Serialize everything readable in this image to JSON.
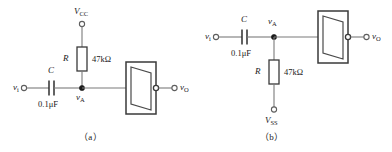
{
  "figure": {
    "background": "#ffffff",
    "wire_color": "#6b6b6b",
    "component_color": "#3a3a3a",
    "text_color": "#1a1a1a"
  },
  "circuits": [
    {
      "caption": "（a）",
      "supply": {
        "label_v": "V",
        "label_sub": "CC",
        "position": "top",
        "terminal": "open-circle"
      },
      "resistor": {
        "ref": "R",
        "value": "47kΩ",
        "orientation": "vertical",
        "position": "above-node"
      },
      "capacitor": {
        "ref": "C",
        "value": "0.1μF",
        "orientation": "horizontal"
      },
      "input": {
        "label_v": "v",
        "label_sub": "i",
        "terminal": "open-circle"
      },
      "node": {
        "label_v": "v",
        "label_sub": "A",
        "terminal": "filled-dot",
        "label_position": "below"
      },
      "amplifier": {
        "symbol": "buffer-box",
        "output_terminal": "open-circle"
      },
      "output": {
        "label_v": "v",
        "label_sub": "O",
        "terminal": "open-circle"
      }
    },
    {
      "caption": "（b）",
      "supply": {
        "label_v": "V",
        "label_sub": "SS",
        "position": "bottom",
        "terminal": "open-circle"
      },
      "resistor": {
        "ref": "R",
        "value": "47kΩ",
        "orientation": "vertical",
        "position": "below-node"
      },
      "capacitor": {
        "ref": "C",
        "value": "0.1μF",
        "orientation": "horizontal"
      },
      "input": {
        "label_v": "v",
        "label_sub": "i",
        "terminal": "open-circle"
      },
      "node": {
        "label_v": "v",
        "label_sub": "A",
        "terminal": "filled-dot",
        "label_position": "above"
      },
      "amplifier": {
        "symbol": "buffer-box",
        "output_terminal": "open-circle"
      },
      "output": {
        "label_v": "v",
        "label_sub": "O",
        "terminal": "open-circle"
      }
    }
  ]
}
